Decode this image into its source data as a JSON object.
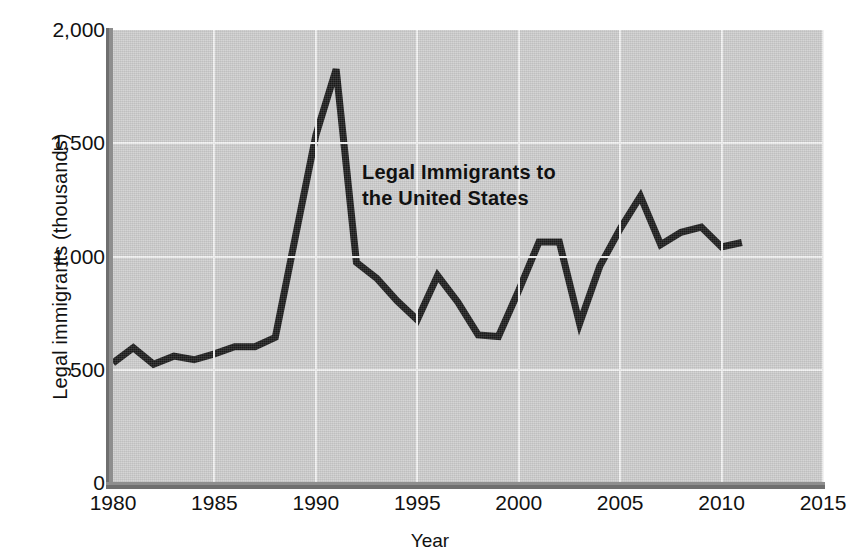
{
  "chart_data": {
    "type": "line",
    "title": "",
    "annotation": "Legal Immigrants to the United States",
    "annotation_line1": "Legal Immigrants to",
    "annotation_line2": "the United States",
    "xlabel": "Year",
    "ylabel": "Legal immigrants (thousands)",
    "xlim": [
      1980,
      2015
    ],
    "ylim": [
      0,
      2000
    ],
    "xticks": [
      1980,
      1985,
      1990,
      1995,
      2000,
      2005,
      2010,
      2015
    ],
    "xticklabels": [
      "1980",
      "1985",
      "1990",
      "1995",
      "2000",
      "2005",
      "2010",
      "2015"
    ],
    "yticks": [
      0,
      500,
      1000,
      1500,
      2000
    ],
    "yticklabels": [
      "0",
      "500",
      "1,000",
      "1,500",
      "2,000"
    ],
    "grid": true,
    "legend": "none",
    "line_color": "#1a1a1a",
    "plot_background": "#cccccc",
    "grid_color": "#f2f2f2",
    "x": [
      1980,
      1981,
      1982,
      1983,
      1984,
      1985,
      1986,
      1987,
      1988,
      1989,
      1990,
      1991,
      1992,
      1993,
      1994,
      1995,
      1996,
      1997,
      1998,
      1999,
      2000,
      2001,
      2002,
      2003,
      2004,
      2005,
      2006,
      2007,
      2008,
      2009,
      2010,
      2011
    ],
    "values": [
      530,
      597,
      524,
      560,
      544,
      570,
      602,
      602,
      643,
      1091,
      1536,
      1827,
      974,
      904,
      804,
      720,
      916,
      798,
      654,
      647,
      850,
      1064,
      1064,
      704,
      958,
      1122,
      1266,
      1052,
      1107,
      1130,
      1042,
      1062
    ]
  }
}
